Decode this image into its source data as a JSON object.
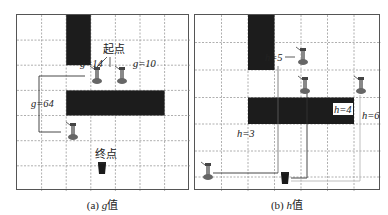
{
  "panels": [
    {
      "id": "a",
      "caption_prefix": "(a) ",
      "caption_var": "g",
      "caption_suffix": "值",
      "grid": {
        "cols": 7,
        "rows": 7
      },
      "obstacles": [
        {
          "col": 2,
          "row": 0,
          "w": 1,
          "h": 2
        },
        {
          "col": 2,
          "row": 3,
          "w": 4,
          "h": 1
        }
      ],
      "labels": {
        "start": "起点",
        "end": "终点",
        "g_left": "g=14",
        "g_right": "g=10",
        "g_far": "g=64"
      }
    },
    {
      "id": "b",
      "caption_prefix": "(b) ",
      "caption_var": "h",
      "caption_suffix": "值",
      "grid": {
        "cols": 7,
        "rows": 7
      },
      "obstacles": [
        {
          "col": 2,
          "row": 0,
          "w": 1,
          "h": 2
        },
        {
          "col": 2,
          "row": 3,
          "w": 4,
          "h": 1
        }
      ],
      "labels": {
        "h5": "h=5",
        "h4": "h=4",
        "h6": "h=6",
        "h3": "h=3"
      }
    }
  ],
  "colors": {
    "obstacle": "#1c1c1c",
    "grid_line": "#9a9a9a",
    "border": "#555555",
    "path_line": "#333333",
    "path_line_light": "#b8b8b8"
  }
}
